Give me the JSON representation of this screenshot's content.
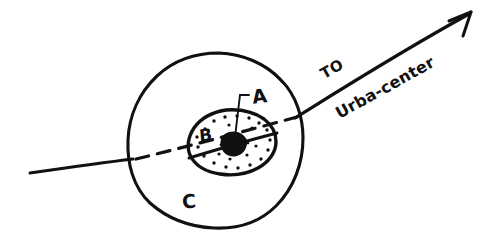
{
  "diagram": {
    "style": "hand-drawn ink on white paper",
    "colors": {
      "ink": "#111111",
      "paper": "#ffffff"
    },
    "zones": [
      {
        "key": "A",
        "label": "A",
        "role": "innermost-core",
        "shape": "small filled ellipse",
        "center": [
          234,
          144
        ],
        "radius": [
          13,
          11
        ],
        "fill": "#111111"
      },
      {
        "key": "B",
        "label": "B",
        "role": "inner-ring-stippled",
        "shape": "ellipse with dotted stipple",
        "center": [
          233,
          141
        ],
        "radius": [
          43,
          32
        ],
        "fill": "none"
      },
      {
        "key": "C",
        "label": "C",
        "role": "outer-ring",
        "shape": "large ellipse",
        "center": [
          215,
          140
        ],
        "radius": [
          88,
          88
        ],
        "fill": "none"
      }
    ],
    "leader_line": {
      "from_label": "A",
      "target": [
        239,
        138
      ]
    },
    "transect": {
      "solid_left": {
        "from": [
          30,
          172
        ],
        "to": [
          132,
          160
        ]
      },
      "dashed_middle": {
        "from": [
          138,
          159
        ],
        "to": [
          296,
          117
        ]
      },
      "solid_arrow": {
        "from": [
          296,
          117
        ],
        "to": [
          470,
          13
        ]
      },
      "arrowhead_at": [
        470,
        13
      ],
      "direction": "up-right"
    },
    "annotations": {
      "to_label": "TO",
      "destination_label": "Urba-center",
      "rotation_degrees": -29
    }
  }
}
